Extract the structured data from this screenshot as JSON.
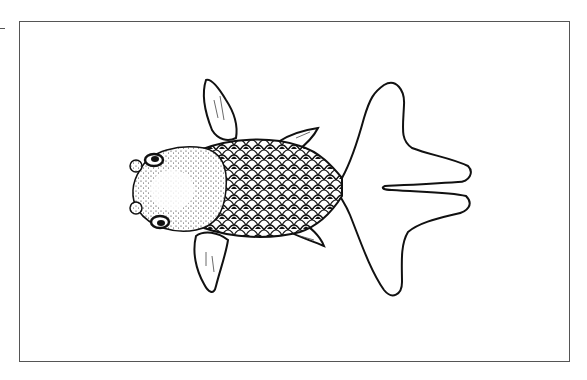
{
  "image": {
    "subject": "Pearlscale goldfish, top-down line illustration",
    "caption": "Goldfish illustration",
    "style": "black ink on white",
    "colors": {
      "ink": "#111111",
      "background": "#ffffff",
      "frame": "#555555"
    }
  }
}
